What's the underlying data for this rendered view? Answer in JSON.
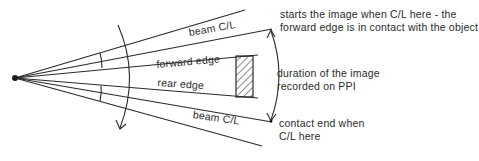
{
  "labels": {
    "beam_cl_upper": "beam C/L",
    "forward_edge": "forward edge",
    "rear_edge": "rear edge",
    "beam_cl_lower": "beam C/L",
    "starts_line1": "starts the image when C/L here - the",
    "starts_line2": "forward edge is in contact with the object",
    "duration_line1": "duration of the image",
    "duration_line2": "recorded on PPI",
    "contact_line1": "contact end when",
    "contact_line2": "C/L here"
  },
  "colors": {
    "line": "#2a2a2a",
    "background": "#ffffff"
  }
}
